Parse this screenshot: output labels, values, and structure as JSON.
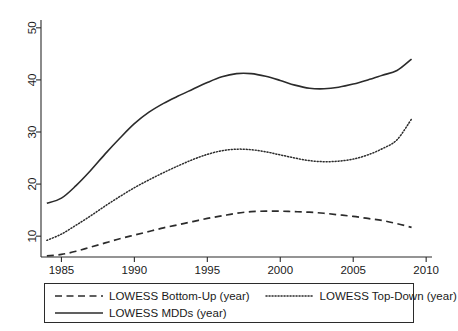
{
  "chart_data": {
    "type": "line",
    "title": "",
    "subtitle": "",
    "xlabel": "",
    "ylabel": "",
    "xlim": [
      1983.6,
      2010.4
    ],
    "ylim": [
      6.0,
      51.5
    ],
    "xticks": [
      1985,
      1990,
      1995,
      2000,
      2005,
      2010
    ],
    "xtick_labels": [
      "1985",
      "1990",
      "1995",
      "2000",
      "2005",
      "2010"
    ],
    "yticks": [
      10,
      20,
      30,
      40,
      50
    ],
    "ytick_labels": [
      "10",
      "20",
      "30",
      "40",
      "50"
    ],
    "grid": false,
    "legend_position": "below-plot",
    "x": [
      1984,
      1985,
      1986,
      1987,
      1988,
      1989,
      1990,
      1991,
      1992,
      1993,
      1994,
      1995,
      1996,
      1997,
      1998,
      1999,
      2000,
      2001,
      2002,
      2003,
      2004,
      2005,
      2006,
      2007,
      2008,
      2009
    ],
    "series": [
      {
        "name": "LOWESS MDDs (year)",
        "style": "solid",
        "values": [
          16.3,
          17.3,
          19.7,
          22.6,
          25.8,
          28.8,
          31.6,
          33.8,
          35.5,
          36.9,
          38.2,
          39.5,
          40.6,
          41.2,
          41.2,
          40.7,
          39.9,
          39.0,
          38.4,
          38.3,
          38.6,
          39.2,
          40.0,
          40.9,
          41.8,
          44.0
        ]
      },
      {
        "name": "LOWESS Top-Down (year)",
        "style": "dotted",
        "values": [
          9.2,
          10.4,
          12.1,
          13.9,
          15.8,
          17.6,
          19.3,
          20.8,
          22.2,
          23.5,
          24.7,
          25.7,
          26.4,
          26.7,
          26.6,
          26.2,
          25.6,
          25.0,
          24.5,
          24.3,
          24.4,
          24.8,
          25.6,
          26.8,
          28.5,
          32.5
        ]
      },
      {
        "name": "LOWESS Bottom-Up (year)",
        "style": "dashed",
        "values": [
          6.2,
          6.5,
          7.1,
          7.9,
          8.7,
          9.5,
          10.2,
          10.9,
          11.6,
          12.2,
          12.8,
          13.4,
          13.9,
          14.4,
          14.7,
          14.8,
          14.8,
          14.7,
          14.6,
          14.4,
          14.1,
          13.8,
          13.4,
          13.0,
          12.4,
          11.7
        ]
      }
    ]
  },
  "legend": {
    "rows": [
      [
        {
          "label": "LOWESS Bottom-Up (year)",
          "style": "dashed"
        },
        {
          "label": "LOWESS Top-Down (year)",
          "style": "dotted"
        }
      ],
      [
        {
          "label": "LOWESS MDDs (year)",
          "style": "solid"
        }
      ]
    ]
  },
  "colors": {
    "line": "#2b2b2b",
    "axis": "#2b2b2b",
    "background": "#ffffff",
    "text": "#1a1a1a"
  }
}
